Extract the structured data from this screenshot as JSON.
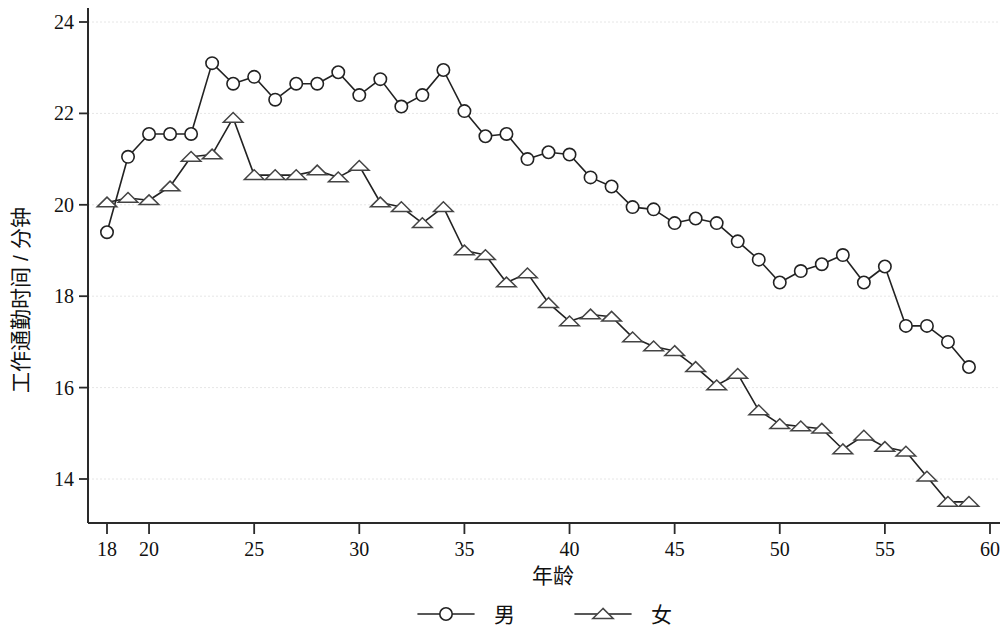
{
  "chart_data": {
    "type": "line",
    "title": "",
    "xlabel": "年龄",
    "ylabel": "工作通勤时间 / 分钟",
    "xlim": [
      17,
      60.5
    ],
    "ylim": [
      13.0,
      24.6
    ],
    "xticks": [
      18,
      20,
      25,
      30,
      35,
      40,
      45,
      50,
      55,
      60
    ],
    "xticklabels": [
      "18",
      "20",
      "25",
      "30",
      "35",
      "40",
      "45",
      "50",
      "55",
      "60"
    ],
    "yticks": [
      14,
      16,
      18,
      20,
      22,
      24
    ],
    "yticklabels": [
      "14",
      "16",
      "18",
      "20",
      "22",
      "24"
    ],
    "grid": true,
    "grid_axis": "y",
    "legend_position": "bottom-center",
    "x": [
      18,
      19,
      20,
      21,
      22,
      23,
      24,
      25,
      26,
      27,
      28,
      29,
      30,
      31,
      32,
      33,
      34,
      35,
      36,
      37,
      38,
      39,
      40,
      41,
      42,
      43,
      44,
      45,
      46,
      47,
      48,
      49,
      50,
      51,
      52,
      53,
      54,
      55,
      56,
      57,
      58,
      59
    ],
    "series": [
      {
        "name": "男",
        "marker": "circle",
        "color": "#222222",
        "values": [
          19.4,
          21.05,
          21.55,
          21.55,
          21.55,
          23.1,
          22.65,
          22.8,
          22.3,
          22.65,
          22.65,
          22.9,
          22.4,
          22.75,
          22.15,
          22.4,
          22.95,
          22.05,
          21.5,
          21.55,
          21.0,
          21.15,
          21.1,
          20.6,
          20.4,
          19.95,
          19.9,
          19.6,
          19.7,
          19.6,
          19.2,
          18.8,
          18.3,
          18.55,
          18.7,
          18.9,
          18.3,
          18.65,
          17.35,
          17.35,
          17.0,
          16.45
        ]
      },
      {
        "name": "女",
        "marker": "triangle",
        "color": "#444444",
        "values": [
          20.05,
          20.15,
          20.1,
          20.4,
          21.05,
          21.1,
          21.9,
          20.65,
          20.65,
          20.65,
          20.75,
          20.6,
          20.85,
          20.05,
          19.95,
          19.6,
          19.95,
          19.0,
          18.9,
          18.3,
          18.5,
          17.85,
          17.45,
          17.6,
          17.55,
          17.1,
          16.9,
          16.8,
          16.45,
          16.05,
          16.3,
          15.5,
          15.2,
          15.15,
          15.1,
          14.65,
          14.95,
          14.7,
          14.6,
          14.05,
          13.5,
          13.5
        ]
      }
    ]
  }
}
